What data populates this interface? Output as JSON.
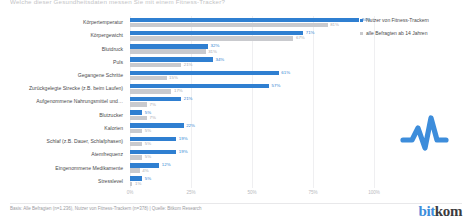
{
  "title": "Welche dieser Gesundheitsdaten messen Sie mit einem Fitness-Tracker?",
  "legend": {
    "position": "top-right",
    "items": [
      {
        "label": "Nutzer von Fitness-Trackern",
        "color": "#2f7fd1"
      },
      {
        "label": "alle Befragten ab 14 Jahren",
        "color": "#c9cace"
      }
    ]
  },
  "axis": {
    "ticks": [
      "0%",
      "25%",
      "50%",
      "75%",
      "100%"
    ]
  },
  "footer": {
    "source": "Basis: Alle Befragten (n=1.236), Nutzer von Fitness-Trackern (n=378) | Quelle: Bitkom Research",
    "logo_bit": "bit",
    "logo_kom": "kom"
  },
  "icons": {
    "pulse": "pulse-waveform-icon",
    "pulse_color": "#3d8ddb"
  },
  "chart_data": {
    "type": "bar",
    "orientation": "horizontal",
    "title": "Welche dieser Gesundheitsdaten messen Sie mit einem Fitness-Tracker?",
    "xlabel": "",
    "ylabel": "",
    "xlim": [
      0,
      100
    ],
    "grid": true,
    "categories": [
      "Körpertemperatur",
      "Körpergewicht",
      "Blutdruck",
      "Puls",
      "Gegangene Schritte",
      "Zurückgelegte Strecke (z.B. beim Laufen)",
      "Aufgenommene Nahrungsmittel und…",
      "Blutzucker",
      "Kalorien",
      "Schlaf (z.B. Dauer, Schlafphasen)",
      "Atemfrequenz",
      "Eingenommene Medikamente",
      "Stresslevel"
    ],
    "series": [
      {
        "name": "Nutzer von Fitness-Trackern",
        "color": "#2f7fd1",
        "values": [
          94,
          71,
          32,
          34,
          61,
          57,
          21,
          5,
          22,
          19,
          19,
          12,
          5
        ],
        "labels": [
          "94%",
          "71%",
          "32%",
          "34%",
          "61%",
          "57%",
          "21%",
          "5%",
          "22%",
          "19%",
          "19%",
          "12%",
          "5%"
        ]
      },
      {
        "name": "alle Befragten ab 14 Jahren",
        "color": "#c9cace",
        "values": [
          81,
          67,
          31,
          21,
          15,
          17,
          7,
          7,
          5,
          5,
          5,
          4,
          1
        ],
        "labels": [
          "81%",
          "67%",
          "31%",
          "21%",
          "15%",
          "17%",
          "7%",
          "7%",
          "5%",
          "5%",
          "5%",
          "4%",
          "1%"
        ]
      }
    ]
  }
}
